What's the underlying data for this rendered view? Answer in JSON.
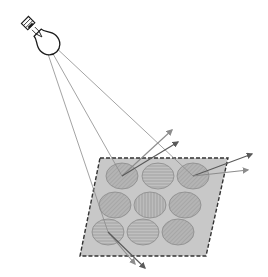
{
  "diagram": {
    "colors": {
      "background": "#ffffff",
      "panel_fill": "#c8c8c8",
      "panel_border": "#333333",
      "circle_fill": "#b4b4b4",
      "circle_stroke": "#8a8a8a",
      "incident_ray": "#8c8c8c",
      "reflected_ray_dark": "#5a5a5a",
      "reflected_ray_light": "#8c8c8c",
      "bulb_outline": "#1a1a1a"
    },
    "light_source": {
      "name": "light-bulb",
      "origin": [
        48,
        45
      ]
    },
    "panel": {
      "points": [
        [
          100,
          158
        ],
        [
          228,
          158
        ],
        [
          206,
          256
        ],
        [
          80,
          256
        ]
      ]
    },
    "circles": [
      {
        "cx": 122,
        "cy": 176,
        "pattern": "diag"
      },
      {
        "cx": 158,
        "cy": 176,
        "pattern": "horiz"
      },
      {
        "cx": 193,
        "cy": 176,
        "pattern": "diag"
      },
      {
        "cx": 115,
        "cy": 205,
        "pattern": "diag"
      },
      {
        "cx": 150,
        "cy": 205,
        "pattern": "vert"
      },
      {
        "cx": 185,
        "cy": 205,
        "pattern": "diag"
      },
      {
        "cx": 108,
        "cy": 232,
        "pattern": "horiz"
      },
      {
        "cx": 143,
        "cy": 232,
        "pattern": "horiz"
      },
      {
        "cx": 178,
        "cy": 232,
        "pattern": "diag"
      }
    ],
    "incident_rays": [
      {
        "from": [
          48,
          45
        ],
        "to": [
          122,
          176
        ]
      },
      {
        "from": [
          52,
          44
        ],
        "to": [
          193,
          176
        ]
      },
      {
        "from": [
          46,
          48
        ],
        "to": [
          108,
          232
        ]
      },
      {
        "from": [
          50,
          46
        ],
        "to": [
          228,
          158
        ]
      }
    ],
    "reflected_rays": [
      {
        "from": [
          122,
          176
        ],
        "to": [
          172,
          130
        ],
        "tone": "light"
      },
      {
        "from": [
          122,
          176
        ],
        "to": [
          178,
          142
        ],
        "tone": "dark"
      },
      {
        "from": [
          193,
          176
        ],
        "to": [
          252,
          154
        ],
        "tone": "dark"
      },
      {
        "from": [
          193,
          176
        ],
        "to": [
          248,
          170
        ],
        "tone": "light"
      },
      {
        "from": [
          108,
          232
        ],
        "to": [
          135,
          264
        ],
        "tone": "light"
      },
      {
        "from": [
          108,
          232
        ],
        "to": [
          145,
          268
        ],
        "tone": "dark"
      }
    ]
  }
}
